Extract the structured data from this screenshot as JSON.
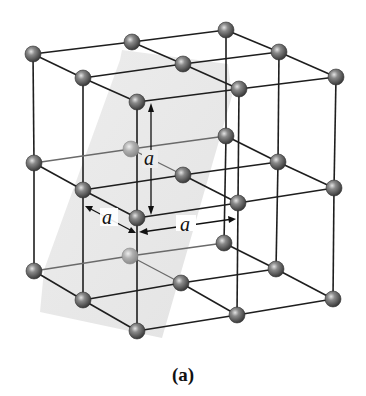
{
  "figure": {
    "caption": "(a)",
    "colors": {
      "edge": "#1e1e1e",
      "atom": "#5a5a5a",
      "atom_highlight": "#d8d8d8",
      "atom_hidden": "#a6a6a6",
      "plane": "#e6e6e6"
    }
  },
  "dimensions": {
    "vertical_label": "a",
    "depth_label": "a",
    "width_label": "a"
  },
  "lattice": {
    "layers": [
      {
        "name": "top",
        "atoms": [
          [
            33,
            54
          ],
          [
            132,
            42
          ],
          [
            226,
            30
          ],
          [
            83,
            78
          ],
          [
            183,
            64
          ],
          [
            279,
            52
          ],
          [
            137,
            102
          ],
          [
            239,
            89
          ],
          [
            336,
            77
          ]
        ]
      },
      {
        "name": "middle",
        "atoms": [
          [
            34,
            163
          ],
          [
            131,
            149
          ],
          [
            226,
            136
          ],
          [
            83,
            190
          ],
          [
            183,
            175
          ],
          [
            278,
            162
          ],
          [
            137,
            218
          ],
          [
            238,
            203
          ],
          [
            334,
            188
          ]
        ]
      },
      {
        "name": "bottom",
        "atoms": [
          [
            34,
            271
          ],
          [
            130,
            256
          ],
          [
            224,
            243
          ],
          [
            83,
            300
          ],
          [
            181,
            283
          ],
          [
            276,
            269
          ],
          [
            137,
            331
          ],
          [
            237,
            315
          ],
          [
            333,
            299
          ]
        ]
      }
    ],
    "hidden_atoms": [
      "middle.1",
      "bottom.1"
    ]
  }
}
